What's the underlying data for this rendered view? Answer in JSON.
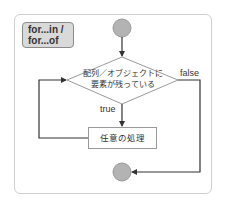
{
  "diagram": {
    "type": "flowchart",
    "label": {
      "line1": "for...in /",
      "line2": "for...of"
    },
    "nodes": [
      {
        "id": "start",
        "kind": "terminal-circle"
      },
      {
        "id": "condition",
        "kind": "decision",
        "line1": "配列／オブジェクトに",
        "line2": "要素が残っている"
      },
      {
        "id": "process",
        "kind": "process",
        "text": "任意の処理"
      },
      {
        "id": "end",
        "kind": "terminal-circle"
      }
    ],
    "edges": [
      {
        "from": "start",
        "to": "condition",
        "label": ""
      },
      {
        "from": "condition",
        "to": "process",
        "label": "true"
      },
      {
        "from": "process",
        "to": "condition",
        "label": ""
      },
      {
        "from": "condition",
        "to": "end",
        "label": "false"
      }
    ],
    "edge_labels": {
      "true": "true",
      "false": "false"
    },
    "colors": {
      "frame": "#cfcfcf",
      "circle_fill": "#b3b3b3",
      "circle_stroke": "#9a9a9a",
      "line": "#333333",
      "label_fill": "#d9d9d9"
    }
  }
}
